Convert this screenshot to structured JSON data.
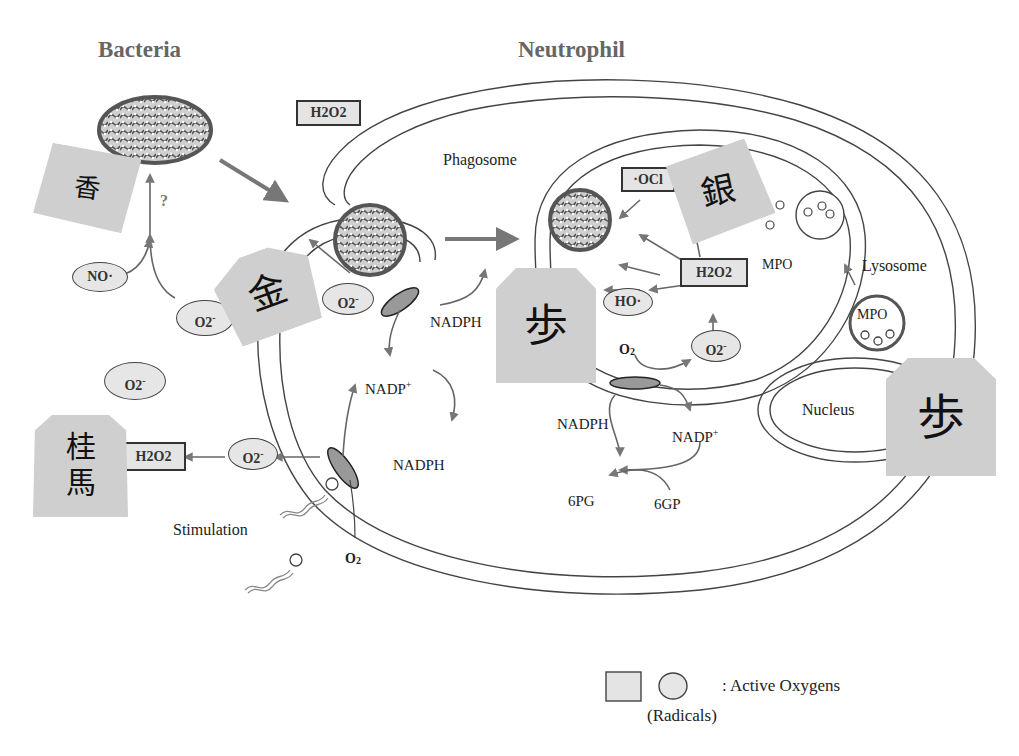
{
  "titles": {
    "bacteria": "Bacteria",
    "neutrophil": "Neutrophil"
  },
  "labels": {
    "phagosome": "Phagosome",
    "lysosome": "Lysosome",
    "nucleus": "Nucleus",
    "stimulation": "Stimulation",
    "nadph_1": "NADPH",
    "nadp_1": "NADP",
    "nadph_2": "NADPH",
    "nadph_3": "NADPH",
    "nadp_2": "NADP",
    "plus": "+",
    "o2_1": "O",
    "o2_2": "O",
    "two": "2",
    "pg6": "6PG",
    "gp6": "6GP",
    "mpo_1": "MPO",
    "mpo_2": "MPO",
    "question": "?"
  },
  "species": {
    "h2o2_top": "H2O2",
    "h2o2_left": "H2O2",
    "h2o2_inner": "H2O2",
    "ocl": "·OCl",
    "no": "NO·",
    "ho": "HO·",
    "o2_radical": "O2",
    "minus": "-"
  },
  "shogi_pieces": {
    "kyosha": "香",
    "keima": "桂馬",
    "kin": "金",
    "gin": "銀",
    "fu": "歩"
  },
  "legend": {
    "label": ": Active Oxygens",
    "sublabel": "(Radicals)"
  },
  "colors": {
    "fill_gray": "#e4e4e4",
    "arrow_gray": "#777777",
    "title_gray": "#666666",
    "piece_gray": "#cfcfcf"
  }
}
